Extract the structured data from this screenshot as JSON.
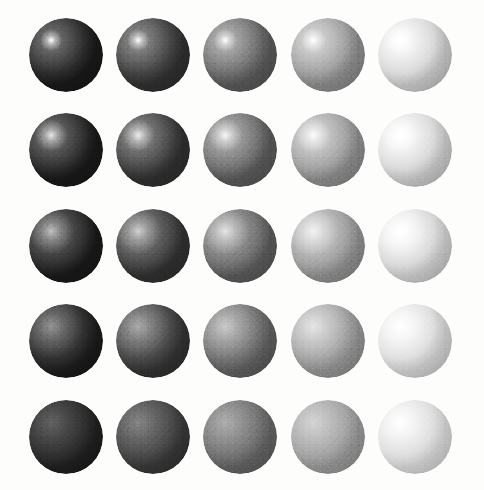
{
  "figure": {
    "background_color": "#fdfdfc",
    "width": 484,
    "height": 490
  },
  "chart_data": {
    "type": "heatmap",
    "xlabel": "Albedo (diffuse lightness) - increasing left to right",
    "ylabel": "Gloss (specular sharpness) - decreasing top to bottom",
    "grid": false,
    "legend": "none",
    "rows": 5,
    "columns": 5,
    "categories": [
      "albedo-1",
      "albedo-2",
      "albedo-3",
      "albedo-4",
      "albedo-5"
    ],
    "row_categories": [
      "gloss-1",
      "gloss-2",
      "gloss-3",
      "gloss-4",
      "gloss-5"
    ],
    "column_albedo_values": [
      0.09,
      0.18,
      0.34,
      0.54,
      0.78
    ],
    "row_gloss_values": [
      1.0,
      0.75,
      0.5,
      0.28,
      0.08
    ],
    "column_albedo_colors": [
      "#181818",
      "#2e2e2e",
      "#575757",
      "#8a8a8a",
      "#c8c8c8"
    ],
    "values": [
      [
        0.09,
        0.18,
        0.34,
        0.54,
        0.78
      ],
      [
        0.09,
        0.18,
        0.34,
        0.54,
        0.78
      ],
      [
        0.09,
        0.18,
        0.34,
        0.54,
        0.78
      ],
      [
        0.09,
        0.18,
        0.34,
        0.54,
        0.78
      ],
      [
        0.09,
        0.18,
        0.34,
        0.54,
        0.78
      ]
    ]
  },
  "lighting": {
    "direction": "upper-left",
    "highlight_x_percent": 30,
    "highlight_y_percent": 30,
    "highlight_color": "#ffffff"
  },
  "layout": {
    "sphere_radius": 37,
    "sphere_diameter": 74,
    "column_centers_x": [
      66,
      153,
      240,
      328,
      415
    ],
    "row_centers_y": [
      55,
      150,
      246,
      341,
      437
    ]
  },
  "spheres": [
    {
      "id": "sphere-r1c1",
      "row": 1,
      "col": 1,
      "cx": 66,
      "cy": 55,
      "base": "#181818",
      "light": "#636363",
      "spec_size": 15,
      "spec_alpha": 1.0,
      "sheen_size": 46,
      "sheen_alpha": 0.16,
      "rim_alpha": 0.3
    },
    {
      "id": "sphere-r1c2",
      "row": 1,
      "col": 2,
      "cx": 153,
      "cy": 55,
      "base": "#2e2e2e",
      "light": "#7d7d7d",
      "spec_size": 15,
      "spec_alpha": 1.0,
      "sheen_size": 46,
      "sheen_alpha": 0.18,
      "rim_alpha": 0.3
    },
    {
      "id": "sphere-r1c3",
      "row": 1,
      "col": 3,
      "cx": 240,
      "cy": 55,
      "base": "#575757",
      "light": "#a9a9a9",
      "spec_size": 16,
      "spec_alpha": 1.0,
      "sheen_size": 50,
      "sheen_alpha": 0.2,
      "rim_alpha": 0.32
    },
    {
      "id": "sphere-r1c4",
      "row": 1,
      "col": 4,
      "cx": 328,
      "cy": 55,
      "base": "#8a8a8a",
      "light": "#d2d2d2",
      "spec_size": 17,
      "spec_alpha": 1.0,
      "sheen_size": 54,
      "sheen_alpha": 0.24,
      "rim_alpha": 0.34
    },
    {
      "id": "sphere-r1c5",
      "row": 1,
      "col": 5,
      "cx": 415,
      "cy": 55,
      "base": "#c8c8c8",
      "light": "#ffffff",
      "spec_size": 20,
      "spec_alpha": 1.0,
      "sheen_size": 60,
      "sheen_alpha": 0.3,
      "rim_alpha": 0.36
    },
    {
      "id": "sphere-r2c1",
      "row": 2,
      "col": 1,
      "cx": 66,
      "cy": 150,
      "base": "#181818",
      "light": "#5e5e5e",
      "spec_size": 22,
      "spec_alpha": 0.8,
      "sheen_size": 52,
      "sheen_alpha": 0.16,
      "rim_alpha": 0.28
    },
    {
      "id": "sphere-r2c2",
      "row": 2,
      "col": 2,
      "cx": 153,
      "cy": 150,
      "base": "#2e2e2e",
      "light": "#7a7a7a",
      "spec_size": 22,
      "spec_alpha": 0.82,
      "sheen_size": 52,
      "sheen_alpha": 0.18,
      "rim_alpha": 0.28
    },
    {
      "id": "sphere-r2c3",
      "row": 2,
      "col": 3,
      "cx": 240,
      "cy": 150,
      "base": "#575757",
      "light": "#a6a6a6",
      "spec_size": 23,
      "spec_alpha": 0.85,
      "sheen_size": 56,
      "sheen_alpha": 0.21,
      "rim_alpha": 0.3
    },
    {
      "id": "sphere-r2c4",
      "row": 2,
      "col": 4,
      "cx": 328,
      "cy": 150,
      "base": "#8a8a8a",
      "light": "#d0d0d0",
      "spec_size": 24,
      "spec_alpha": 0.88,
      "sheen_size": 60,
      "sheen_alpha": 0.25,
      "rim_alpha": 0.32
    },
    {
      "id": "sphere-r2c5",
      "row": 2,
      "col": 5,
      "cx": 415,
      "cy": 150,
      "base": "#c8c8c8",
      "light": "#ffffff",
      "spec_size": 27,
      "spec_alpha": 0.92,
      "sheen_size": 66,
      "sheen_alpha": 0.32,
      "rim_alpha": 0.34
    },
    {
      "id": "sphere-r3c1",
      "row": 3,
      "col": 1,
      "cx": 66,
      "cy": 246,
      "base": "#181818",
      "light": "#565656",
      "spec_size": 31,
      "spec_alpha": 0.55,
      "sheen_size": 60,
      "sheen_alpha": 0.15,
      "rim_alpha": 0.25
    },
    {
      "id": "sphere-r3c2",
      "row": 3,
      "col": 2,
      "cx": 153,
      "cy": 246,
      "base": "#2e2e2e",
      "light": "#737373",
      "spec_size": 31,
      "spec_alpha": 0.58,
      "sheen_size": 60,
      "sheen_alpha": 0.17,
      "rim_alpha": 0.25
    },
    {
      "id": "sphere-r3c3",
      "row": 3,
      "col": 3,
      "cx": 240,
      "cy": 246,
      "base": "#575757",
      "light": "#a0a0a0",
      "spec_size": 32,
      "spec_alpha": 0.62,
      "sheen_size": 64,
      "sheen_alpha": 0.2,
      "rim_alpha": 0.27
    },
    {
      "id": "sphere-r3c4",
      "row": 3,
      "col": 4,
      "cx": 328,
      "cy": 246,
      "base": "#8a8a8a",
      "light": "#cccccc",
      "spec_size": 34,
      "spec_alpha": 0.66,
      "sheen_size": 68,
      "sheen_alpha": 0.24,
      "rim_alpha": 0.29
    },
    {
      "id": "sphere-r3c5",
      "row": 3,
      "col": 5,
      "cx": 415,
      "cy": 246,
      "base": "#c8c8c8",
      "light": "#ffffff",
      "spec_size": 38,
      "spec_alpha": 0.72,
      "sheen_size": 74,
      "sheen_alpha": 0.32,
      "rim_alpha": 0.31
    },
    {
      "id": "sphere-r4c1",
      "row": 4,
      "col": 1,
      "cx": 66,
      "cy": 341,
      "base": "#181818",
      "light": "#4c4c4c",
      "spec_size": 44,
      "spec_alpha": 0.3,
      "sheen_size": 70,
      "sheen_alpha": 0.13,
      "rim_alpha": 0.22
    },
    {
      "id": "sphere-r4c2",
      "row": 4,
      "col": 2,
      "cx": 153,
      "cy": 341,
      "base": "#2e2e2e",
      "light": "#6b6b6b",
      "spec_size": 44,
      "spec_alpha": 0.32,
      "sheen_size": 70,
      "sheen_alpha": 0.15,
      "rim_alpha": 0.22
    },
    {
      "id": "sphere-r4c3",
      "row": 4,
      "col": 3,
      "cx": 240,
      "cy": 341,
      "base": "#575757",
      "light": "#999999",
      "spec_size": 46,
      "spec_alpha": 0.35,
      "sheen_size": 74,
      "sheen_alpha": 0.18,
      "rim_alpha": 0.24
    },
    {
      "id": "sphere-r4c4",
      "row": 4,
      "col": 4,
      "cx": 328,
      "cy": 341,
      "base": "#8a8a8a",
      "light": "#c6c6c6",
      "spec_size": 48,
      "spec_alpha": 0.38,
      "sheen_size": 78,
      "sheen_alpha": 0.22,
      "rim_alpha": 0.26
    },
    {
      "id": "sphere-r4c5",
      "row": 4,
      "col": 5,
      "cx": 415,
      "cy": 341,
      "base": "#c8c8c8",
      "light": "#ffffff",
      "spec_size": 52,
      "spec_alpha": 0.46,
      "sheen_size": 84,
      "sheen_alpha": 0.3,
      "rim_alpha": 0.28
    },
    {
      "id": "sphere-r5c1",
      "row": 5,
      "col": 1,
      "cx": 66,
      "cy": 437,
      "base": "#181818",
      "light": "#3c3c3c",
      "spec_size": 62,
      "spec_alpha": 0.1,
      "sheen_size": 84,
      "sheen_alpha": 0.1,
      "rim_alpha": 0.18
    },
    {
      "id": "sphere-r5c2",
      "row": 5,
      "col": 2,
      "cx": 153,
      "cy": 437,
      "base": "#2e2e2e",
      "light": "#606060",
      "spec_size": 62,
      "spec_alpha": 0.12,
      "sheen_size": 84,
      "sheen_alpha": 0.12,
      "rim_alpha": 0.18
    },
    {
      "id": "sphere-r5c3",
      "row": 5,
      "col": 3,
      "cx": 240,
      "cy": 437,
      "base": "#575757",
      "light": "#8f8f8f",
      "spec_size": 64,
      "spec_alpha": 0.14,
      "sheen_size": 88,
      "sheen_alpha": 0.15,
      "rim_alpha": 0.2
    },
    {
      "id": "sphere-r5c4",
      "row": 5,
      "col": 4,
      "cx": 328,
      "cy": 437,
      "base": "#8a8a8a",
      "light": "#bfbfbf",
      "spec_size": 66,
      "spec_alpha": 0.16,
      "sheen_size": 92,
      "sheen_alpha": 0.19,
      "rim_alpha": 0.22
    },
    {
      "id": "sphere-r5c5",
      "row": 5,
      "col": 5,
      "cx": 415,
      "cy": 437,
      "base": "#c8c8c8",
      "light": "#ffffff",
      "spec_size": 70,
      "spec_alpha": 0.24,
      "sheen_size": 98,
      "sheen_alpha": 0.28,
      "rim_alpha": 0.24
    }
  ]
}
